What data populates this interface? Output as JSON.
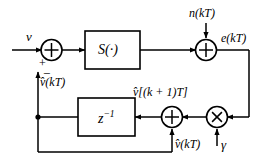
{
  "figure": {
    "type": "block-diagram",
    "background": "#ffffff",
    "line_color": "#000000"
  },
  "labels": {
    "input_signal": "v",
    "noise_input": "n(kT)",
    "error_signal": "e(kT)",
    "feedback_estimate_top": "v̂(kT)",
    "next_state_estimate": "v̂[(k + 1)T]",
    "feedback_estimate_bottom": "v̂(kT)",
    "gain_label": "γ",
    "plus_sign": "+",
    "minus_sign": "−"
  },
  "blocks": [
    {
      "name": "nonlinearity-block",
      "label": "S(·)",
      "shape": "rectangle"
    },
    {
      "name": "delay-block",
      "label": "z",
      "exponent": "−1",
      "shape": "rectangle"
    }
  ],
  "nodes": [
    {
      "name": "summing-junction-input",
      "symbol": "⊕",
      "inputs": [
        "v",
        "v̂(kT)"
      ],
      "signs": [
        "+",
        "−"
      ]
    },
    {
      "name": "summing-junction-noise",
      "symbol": "⊕",
      "inputs": [
        "S(·) output",
        "n(kT)"
      ]
    },
    {
      "name": "summing-junction-delay",
      "symbol": "⊕",
      "inputs": [
        "γ e(kT)",
        "v̂(kT)"
      ]
    },
    {
      "name": "multiplier-junction-gain",
      "symbol": "⊗",
      "inputs": [
        "e(kT)",
        "γ"
      ]
    }
  ]
}
